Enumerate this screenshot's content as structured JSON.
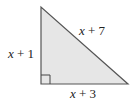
{
  "diagram": {
    "type": "right-triangle",
    "fill_color": "#e6e6e6",
    "stroke_color": "#555555",
    "vertices": {
      "top": [
        41,
        7
      ],
      "bottom_left": [
        41,
        84
      ],
      "bottom_right": [
        128,
        84
      ]
    },
    "right_angle_marker": "bottom-left",
    "sides": {
      "vertical_leg": {
        "var": "x",
        "rest": " + 1"
      },
      "horizontal_leg": {
        "var": "x",
        "rest": " + 3"
      },
      "hypotenuse": {
        "var": "x",
        "rest": " + 7"
      }
    }
  }
}
